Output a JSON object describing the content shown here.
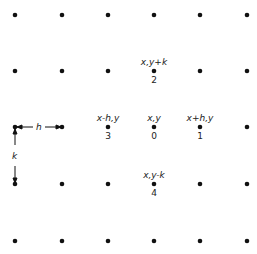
{
  "grid": {
    "columns_x": [
      15,
      62,
      108,
      154,
      200,
      247
    ],
    "rows_y": [
      15,
      71,
      127,
      184,
      241
    ],
    "dot_radius": 2.3,
    "dot_color": "#111111"
  },
  "nodes": [
    {
      "id": "0",
      "coord_label": "x,y",
      "number": "0",
      "col": 3,
      "row": 2
    },
    {
      "id": "1",
      "coord_label": "x+h,y",
      "number": "1",
      "col": 4,
      "row": 2
    },
    {
      "id": "2",
      "coord_label": "x,y+k",
      "number": "2",
      "col": 3,
      "row": 1
    },
    {
      "id": "3",
      "coord_label": "x-h,y",
      "number": "3",
      "col": 2,
      "row": 2
    },
    {
      "id": "4",
      "coord_label": "x,y-k",
      "number": "4",
      "col": 3,
      "row": 3
    }
  ],
  "spacing": {
    "horizontal_label": "h",
    "vertical_label": "k"
  }
}
